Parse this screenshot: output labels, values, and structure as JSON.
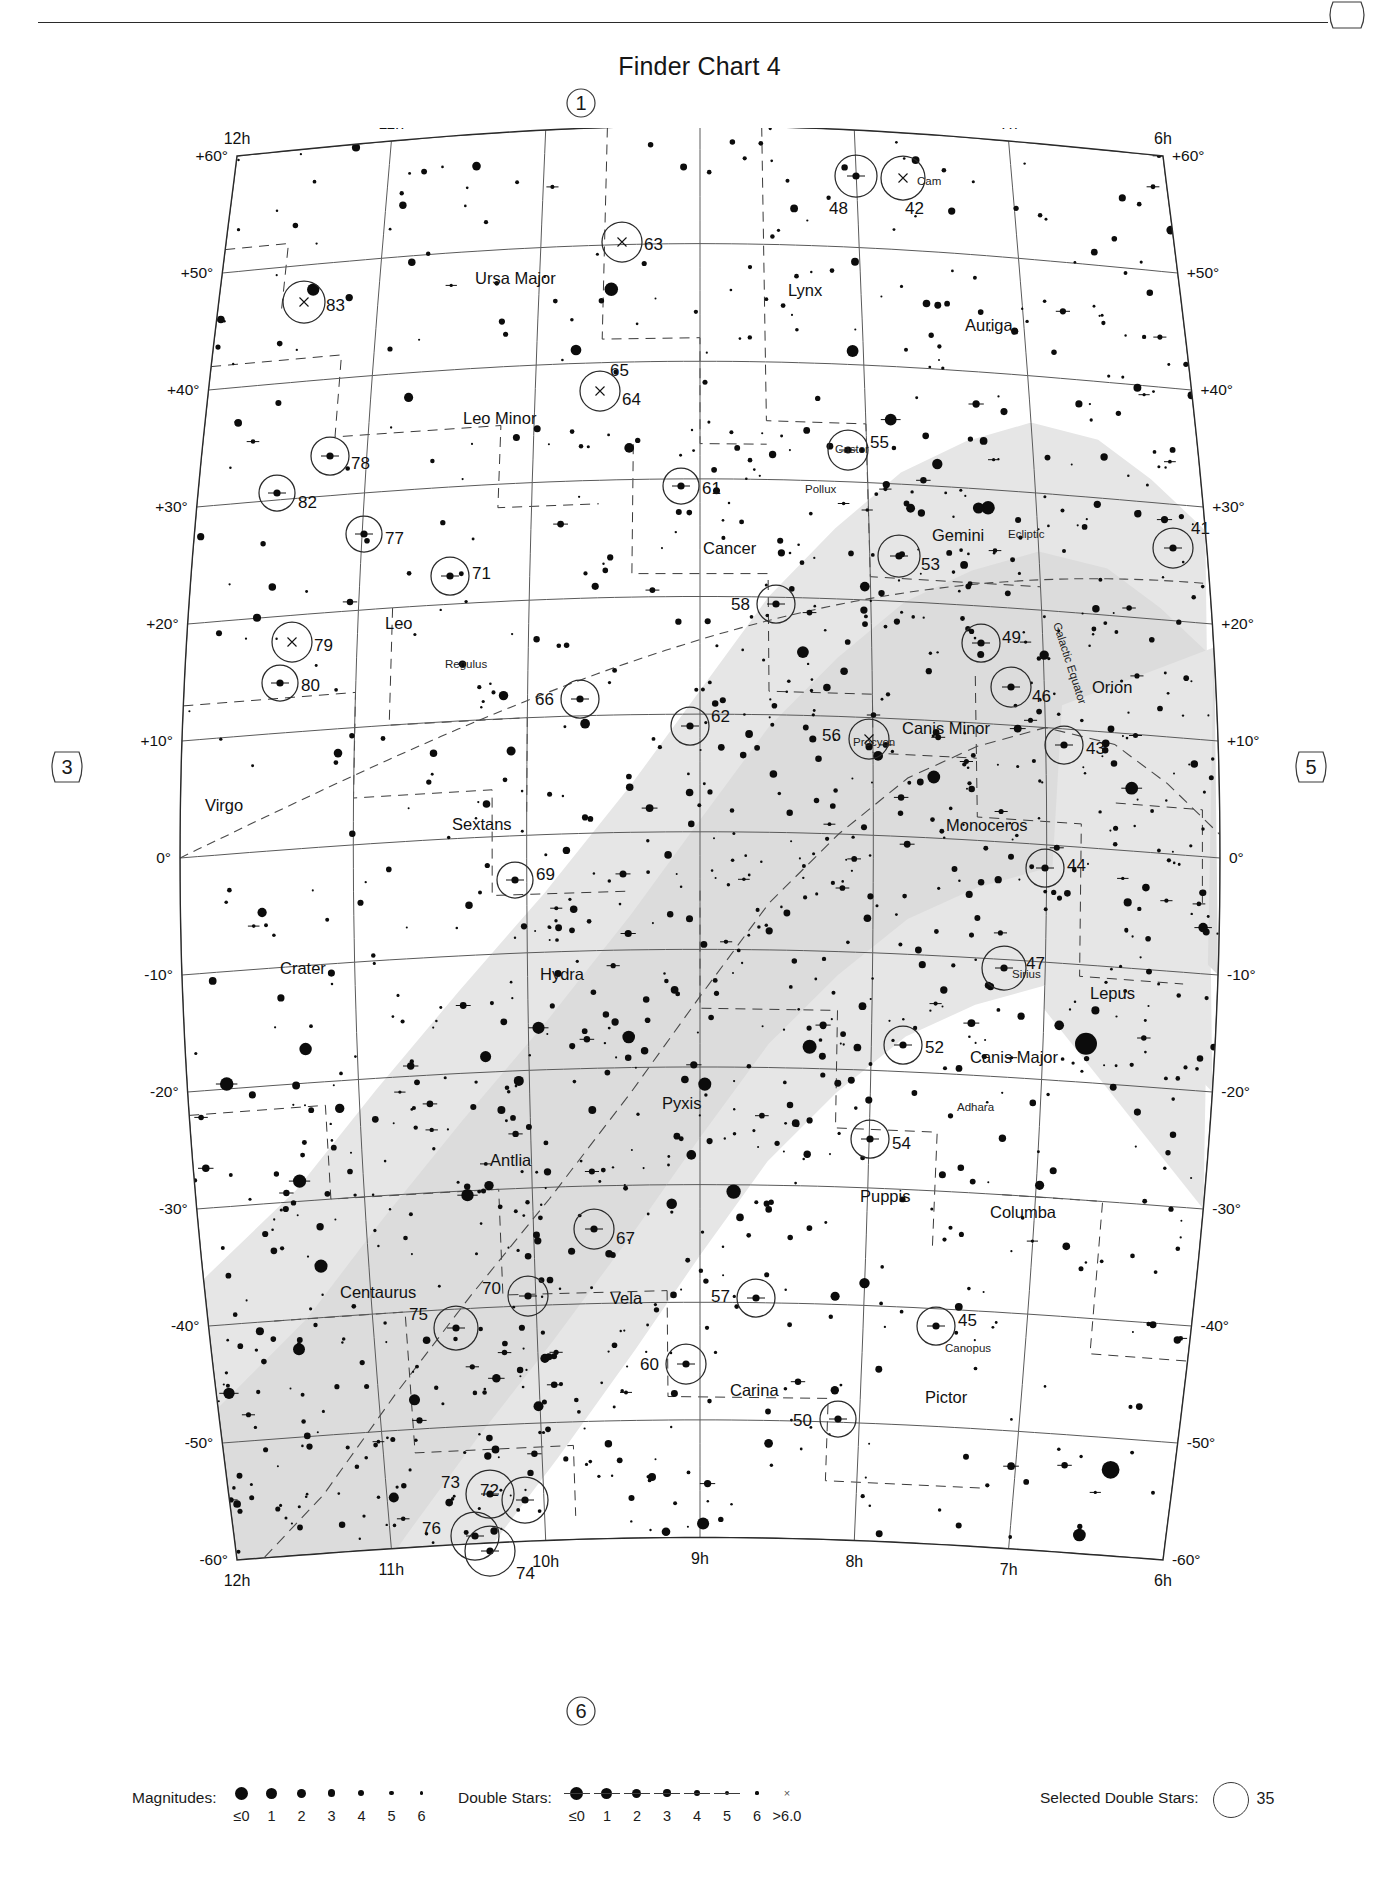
{
  "header": {
    "title": "Finder Chart 4"
  },
  "edge_tags": {
    "top": "1",
    "bottom": "6",
    "left": "3",
    "right": "5",
    "corner": ""
  },
  "axes": {
    "ra_top": [
      "12h",
      "11h",
      "10h",
      "9h",
      "8h",
      "7h",
      "6h"
    ],
    "ra_bottom": [
      "12h",
      "11h",
      "10h",
      "9h",
      "8h",
      "7h",
      "6h"
    ],
    "dec_left": [
      "+60°",
      "+50°",
      "+40°",
      "+30°",
      "+20°",
      "+10°",
      "0°",
      "-10°",
      "-20°",
      "-30°",
      "-40°",
      "-50°",
      "-60°"
    ],
    "dec_right": [
      "+60°",
      "+50°",
      "+40°",
      "+30°",
      "+20°",
      "+10°",
      "0°",
      "-10°",
      "-20°",
      "-30°",
      "-40°",
      "-50°",
      "-60°"
    ]
  },
  "constellations": [
    {
      "name": "Ursa Major",
      "x": 295,
      "y": 128
    },
    {
      "name": "Lynx",
      "x": 608,
      "y": 140
    },
    {
      "name": "Auriga",
      "x": 785,
      "y": 175
    },
    {
      "name": "Leo Minor",
      "x": 283,
      "y": 268
    },
    {
      "name": "Cancer",
      "x": 523,
      "y": 398
    },
    {
      "name": "Gemini",
      "x": 752,
      "y": 385
    },
    {
      "name": "Leo",
      "x": 205,
      "y": 473
    },
    {
      "name": "Orion",
      "x": 912,
      "y": 537
    },
    {
      "name": "Canis Minor",
      "x": 722,
      "y": 578
    },
    {
      "name": "Virgo",
      "x": 25,
      "y": 655
    },
    {
      "name": "Sextans",
      "x": 272,
      "y": 674
    },
    {
      "name": "Monoceros",
      "x": 766,
      "y": 675
    },
    {
      "name": "Crater",
      "x": 100,
      "y": 818
    },
    {
      "name": "Hydra",
      "x": 360,
      "y": 824
    },
    {
      "name": "Lepus",
      "x": 910,
      "y": 843
    },
    {
      "name": "Canis Major",
      "x": 790,
      "y": 907
    },
    {
      "name": "Pyxis",
      "x": 482,
      "y": 953
    },
    {
      "name": "Antlia",
      "x": 310,
      "y": 1010
    },
    {
      "name": "Puppis",
      "x": 680,
      "y": 1046
    },
    {
      "name": "Columba",
      "x": 810,
      "y": 1062
    },
    {
      "name": "Centaurus",
      "x": 160,
      "y": 1142
    },
    {
      "name": "Vela",
      "x": 430,
      "y": 1148
    },
    {
      "name": "Carina",
      "x": 550,
      "y": 1240
    },
    {
      "name": "Pictor",
      "x": 745,
      "y": 1247
    }
  ],
  "named_stars": [
    {
      "name": "Cam",
      "x": 737,
      "y": 29
    },
    {
      "name": "Castor",
      "x": 655,
      "y": 297
    },
    {
      "name": "Pollux",
      "x": 625,
      "y": 337
    },
    {
      "name": "Regulus",
      "x": 265,
      "y": 512
    },
    {
      "name": "Procyon",
      "x": 673,
      "y": 590
    },
    {
      "name": "Sirius",
      "x": 832,
      "y": 822
    },
    {
      "name": "Adhara",
      "x": 777,
      "y": 955
    },
    {
      "name": "Canopus",
      "x": 765,
      "y": 1196
    }
  ],
  "reference_lines": [
    {
      "name": "Ecliptic",
      "x": 828,
      "y": 382
    },
    {
      "name": "Galactic Equator",
      "x": 873,
      "y": 468
    }
  ],
  "selected_doubles": [
    {
      "id": "41",
      "cx": 993,
      "cy": 392,
      "r": 20,
      "label_dx": 18,
      "label_dy": -20,
      "kind": "double"
    },
    {
      "id": "42",
      "cx": 723,
      "cy": 22,
      "r": 22,
      "label_dx": 2,
      "label_dy": 30,
      "kind": "x"
    },
    {
      "id": "43",
      "cx": 884,
      "cy": 589,
      "r": 19,
      "label_dx": 22,
      "label_dy": 3,
      "kind": "double"
    },
    {
      "id": "44",
      "cx": 865,
      "cy": 712,
      "r": 19,
      "label_dx": 22,
      "label_dy": -3,
      "kind": "double"
    },
    {
      "id": "45",
      "cx": 756,
      "cy": 1170,
      "r": 19,
      "label_dx": 22,
      "label_dy": -6,
      "kind": "double"
    },
    {
      "id": "46",
      "cx": 831,
      "cy": 531,
      "r": 20,
      "label_dx": 21,
      "label_dy": 9,
      "kind": "double"
    },
    {
      "id": "47",
      "cx": 824,
      "cy": 812,
      "r": 22,
      "label_dx": 22,
      "label_dy": -5,
      "kind": "double"
    },
    {
      "id": "48",
      "cx": 676,
      "cy": 20,
      "r": 21,
      "label_dx": -8,
      "label_dy": 32,
      "kind": "double"
    },
    {
      "id": "49",
      "cx": 801,
      "cy": 487,
      "r": 19,
      "label_dx": 21,
      "label_dy": -6,
      "kind": "double"
    },
    {
      "id": "50",
      "cx": 658,
      "cy": 1263,
      "r": 18,
      "label_dx": -26,
      "label_dy": 1,
      "kind": "double"
    },
    {
      "id": "52",
      "cx": 723,
      "cy": 889,
      "r": 19,
      "label_dx": 22,
      "label_dy": 2,
      "kind": "double"
    },
    {
      "id": "53",
      "cx": 719,
      "cy": 400,
      "r": 21,
      "label_dx": 22,
      "label_dy": 8,
      "kind": "double"
    },
    {
      "id": "54",
      "cx": 690,
      "cy": 983,
      "r": 19,
      "label_dx": 22,
      "label_dy": 4,
      "kind": "double"
    },
    {
      "id": "55",
      "cx": 668,
      "cy": 294,
      "r": 20,
      "label_dx": 22,
      "label_dy": -8,
      "kind": "double"
    },
    {
      "id": "56",
      "cx": 689,
      "cy": 583,
      "r": 20,
      "label_dx": -28,
      "label_dy": -4,
      "kind": "x"
    },
    {
      "id": "57",
      "cx": 576,
      "cy": 1142,
      "r": 19,
      "label_dx": -26,
      "label_dy": -2,
      "kind": "double"
    },
    {
      "id": "58",
      "cx": 596,
      "cy": 448,
      "r": 19,
      "label_dx": -26,
      "label_dy": 0,
      "kind": "double"
    },
    {
      "id": "60",
      "cx": 506,
      "cy": 1208,
      "r": 20,
      "label_dx": -27,
      "label_dy": 0,
      "kind": "double"
    },
    {
      "id": "61",
      "cx": 501,
      "cy": 330,
      "r": 18,
      "label_dx": 21,
      "label_dy": 2,
      "kind": "double"
    },
    {
      "id": "62",
      "cx": 510,
      "cy": 570,
      "r": 19,
      "label_dx": 21,
      "label_dy": -10,
      "kind": "double"
    },
    {
      "id": "63",
      "cx": 442,
      "cy": 86,
      "r": 20,
      "label_dx": 22,
      "label_dy": 2,
      "kind": "x"
    },
    {
      "id": "64",
      "cx": 420,
      "cy": 235,
      "r": 20,
      "label_dx": 22,
      "label_dy": 8,
      "kind": "x"
    },
    {
      "id": "65",
      "cx": 420,
      "cy": 228,
      "r": 0,
      "label_dx": 10,
      "label_dy": -14,
      "kind": "none"
    },
    {
      "id": "66",
      "cx": 400,
      "cy": 543,
      "r": 19,
      "label_dx": -26,
      "label_dy": 0,
      "kind": "double"
    },
    {
      "id": "67",
      "cx": 414,
      "cy": 1073,
      "r": 20,
      "label_dx": 22,
      "label_dy": 9,
      "kind": "double"
    },
    {
      "id": "69",
      "cx": 335,
      "cy": 724,
      "r": 18,
      "label_dx": 21,
      "label_dy": -6,
      "kind": "double"
    },
    {
      "id": "70",
      "cx": 348,
      "cy": 1140,
      "r": 20,
      "label_dx": -27,
      "label_dy": -8,
      "kind": "double"
    },
    {
      "id": "71",
      "cx": 270,
      "cy": 420,
      "r": 19,
      "label_dx": 22,
      "label_dy": -3,
      "kind": "double"
    },
    {
      "id": "72",
      "cx": 345,
      "cy": 1344,
      "r": 23,
      "label_dx": -26,
      "label_dy": -10,
      "kind": "double"
    },
    {
      "id": "73",
      "cx": 310,
      "cy": 1338,
      "r": 24,
      "label_dx": -30,
      "label_dy": -12,
      "kind": "double"
    },
    {
      "id": "74",
      "cx": 310,
      "cy": 1395,
      "r": 25,
      "label_dx": 26,
      "label_dy": 22,
      "kind": "double"
    },
    {
      "id": "75",
      "cx": 276,
      "cy": 1172,
      "r": 22,
      "label_dx": -28,
      "label_dy": -14,
      "kind": "double"
    },
    {
      "id": "76",
      "cx": 295,
      "cy": 1380,
      "r": 24,
      "label_dx": -34,
      "label_dy": -8,
      "kind": "double"
    },
    {
      "id": "77",
      "cx": 184,
      "cy": 378,
      "r": 18,
      "label_dx": 21,
      "label_dy": 4,
      "kind": "double"
    },
    {
      "id": "78",
      "cx": 150,
      "cy": 300,
      "r": 19,
      "label_dx": 21,
      "label_dy": 7,
      "kind": "double"
    },
    {
      "id": "79",
      "cx": 112,
      "cy": 486,
      "r": 20,
      "label_dx": 22,
      "label_dy": 3,
      "kind": "x"
    },
    {
      "id": "80",
      "cx": 100,
      "cy": 527,
      "r": 18,
      "label_dx": 21,
      "label_dy": 2,
      "kind": "double"
    },
    {
      "id": "82",
      "cx": 97,
      "cy": 337,
      "r": 18,
      "label_dx": 21,
      "label_dy": 9,
      "kind": "double"
    },
    {
      "id": "83",
      "cx": 124,
      "cy": 146,
      "r": 21,
      "label_dx": 22,
      "label_dy": 3,
      "kind": "x"
    }
  ],
  "legend": {
    "magnitudes": {
      "label": "Magnitudes:",
      "items": [
        {
          "mag": "≤0",
          "size": 13
        },
        {
          "mag": "1",
          "size": 11
        },
        {
          "mag": "2",
          "size": 9
        },
        {
          "mag": "3",
          "size": 7.5
        },
        {
          "mag": "4",
          "size": 6
        },
        {
          "mag": "5",
          "size": 4.5
        },
        {
          "mag": "6",
          "size": 3.2
        }
      ]
    },
    "double_stars": {
      "label": "Double Stars:",
      "items": [
        {
          "mag": "≤0",
          "size": 13,
          "bar": true
        },
        {
          "mag": "1",
          "size": 11,
          "bar": true
        },
        {
          "mag": "2",
          "size": 9,
          "bar": true
        },
        {
          "mag": "3",
          "size": 7.5,
          "bar": true
        },
        {
          "mag": "4",
          "size": 6,
          "bar": true
        },
        {
          "mag": "5",
          "size": 4.5,
          "bar": true
        },
        {
          "mag": "6",
          "size": 3.2,
          "bar": false
        },
        {
          "mag": ">6.0",
          "size": 0,
          "bar": false,
          "x": true
        }
      ]
    },
    "selected_double_stars": {
      "label": "Selected Double Stars:",
      "sample_number": "35"
    }
  },
  "chart_data": {
    "type": "scatter",
    "title": "Finder Chart 4",
    "projection": "conic star atlas chart",
    "xlabel": "Right Ascension (hours)",
    "ylabel": "Declination (degrees)",
    "xlim": [
      6,
      12
    ],
    "ylim": [
      -60,
      60
    ],
    "x_ticks": [
      "12h",
      "11h",
      "10h",
      "9h",
      "8h",
      "7h",
      "6h"
    ],
    "y_ticks": [
      "+60°",
      "+50°",
      "+40°",
      "+30°",
      "+20°",
      "+10°",
      "0°",
      "-10°",
      "-20°",
      "-30°",
      "-40°",
      "-50°",
      "-60°"
    ],
    "grid": true,
    "legend_position": "below chart",
    "overlays": [
      "Ecliptic",
      "Galactic Equator",
      "Milky Way band",
      "constellation boundaries"
    ],
    "series": [
      {
        "name": "Stars by magnitude",
        "values": [
          "≤0",
          "1",
          "2",
          "3",
          "4",
          "5",
          "6"
        ]
      },
      {
        "name": "Double stars",
        "values": [
          "≤0",
          "1",
          "2",
          "3",
          "4",
          "5",
          "6",
          ">6.0"
        ]
      },
      {
        "name": "Selected double stars",
        "values": [
          "41",
          "42",
          "43",
          "44",
          "45",
          "46",
          "47",
          "48",
          "49",
          "50",
          "52",
          "53",
          "54",
          "55",
          "56",
          "57",
          "58",
          "60",
          "61",
          "62",
          "63",
          "64",
          "65",
          "66",
          "67",
          "69",
          "70",
          "71",
          "72",
          "73",
          "74",
          "75",
          "76",
          "77",
          "78",
          "79",
          "80",
          "82",
          "83"
        ]
      }
    ]
  }
}
